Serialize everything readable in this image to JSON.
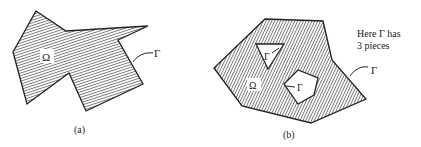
{
  "figure_a": {
    "region_label": "Ω",
    "boundary_label": "Γ",
    "caption": "(a)",
    "hatch": "horizontal"
  },
  "figure_b": {
    "region_label": "Ω",
    "boundary_label_outer": "Γ",
    "boundary_label_triangle": "Γ",
    "boundary_label_pentagon": "Γ",
    "caption": "(b)",
    "hatch": "vertical",
    "note_line1": "Here Γ has",
    "note_line2": "3 pieces"
  },
  "colors": {
    "stroke": "#222222",
    "hatch": "#555555",
    "background": "#ffffff"
  }
}
